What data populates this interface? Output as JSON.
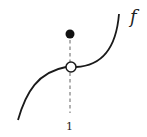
{
  "diagram": {
    "function_label": "f",
    "x_tick_label": "1",
    "colors": {
      "curve": "#1a1a1a",
      "dashed_line": "#888888",
      "filled_point": "#111111",
      "open_point_fill": "#ffffff"
    },
    "points": {
      "open_circle": {
        "cx": 71,
        "cy": 67,
        "r": 5
      },
      "filled_dot": {
        "cx": 70,
        "cy": 34,
        "r": 4.5
      }
    }
  }
}
